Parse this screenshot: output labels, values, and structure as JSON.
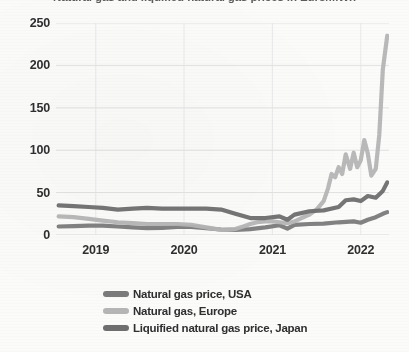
{
  "chart_data": {
    "type": "line",
    "title": "Natural gas and liquified natural gas prices in Euro/MWh",
    "xlabel": "",
    "ylabel": "",
    "ylim": [
      0,
      250
    ],
    "xlim": [
      2018.55,
      2022.32
    ],
    "yticks": [
      0,
      50,
      100,
      150,
      200,
      250
    ],
    "ytick_labels": [
      "0",
      "50",
      "100",
      "150",
      "200",
      "250"
    ],
    "xticks": [
      2019,
      2020,
      2021,
      2022
    ],
    "xtick_labels": [
      "2019",
      "2020",
      "2021",
      "2022"
    ],
    "grid": true,
    "grid_axis": "y",
    "legend_position": "bottom",
    "series": [
      {
        "name": "Natural gas price, USA",
        "color": "#7b7b7b",
        "x": [
          2018.58,
          2018.75,
          2018.92,
          2019.08,
          2019.25,
          2019.42,
          2019.58,
          2019.75,
          2019.92,
          2020.08,
          2020.25,
          2020.42,
          2020.58,
          2020.75,
          2020.92,
          2021.08,
          2021.17,
          2021.25,
          2021.42,
          2021.58,
          2021.75,
          2021.92,
          2022.0,
          2022.08,
          2022.17,
          2022.25,
          2022.3
        ],
        "values": [
          10,
          10.5,
          11,
          11,
          10,
          9,
          8,
          8.5,
          9.5,
          9.5,
          8,
          6.5,
          6,
          7,
          9,
          11.5,
          7.5,
          12,
          13,
          13.5,
          15,
          16,
          14.5,
          18,
          21,
          25,
          27
        ]
      },
      {
        "name": "Natural gas, Europe",
        "color": "#b5b5b5",
        "x": [
          2018.58,
          2018.75,
          2018.92,
          2019.08,
          2019.25,
          2019.42,
          2019.58,
          2019.75,
          2019.92,
          2020.08,
          2020.25,
          2020.42,
          2020.58,
          2020.67,
          2020.75,
          2020.83,
          2020.92,
          2021.0,
          2021.08,
          2021.17,
          2021.25,
          2021.33,
          2021.42,
          2021.5,
          2021.58,
          2021.63,
          2021.67,
          2021.71,
          2021.75,
          2021.79,
          2021.83,
          2021.88,
          2021.92,
          2021.96,
          2022.0,
          2022.04,
          2022.08,
          2022.12,
          2022.17,
          2022.21,
          2022.25,
          2022.3
        ],
        "values": [
          22,
          21,
          19,
          17,
          15,
          14,
          13,
          13,
          13,
          12,
          9,
          6,
          7,
          10,
          13,
          15,
          16,
          16,
          15,
          14,
          16,
          20,
          24,
          30,
          40,
          55,
          72,
          68,
          80,
          72,
          95,
          78,
          97,
          80,
          88,
          112,
          96,
          70,
          78,
          118,
          195,
          235
        ]
      },
      {
        "name": "Liquified natural gas price, Japan",
        "color": "#6e6e6e",
        "x": [
          2018.58,
          2018.75,
          2018.92,
          2019.08,
          2019.25,
          2019.42,
          2019.58,
          2019.75,
          2019.92,
          2020.08,
          2020.25,
          2020.42,
          2020.58,
          2020.75,
          2020.92,
          2021.08,
          2021.17,
          2021.25,
          2021.42,
          2021.58,
          2021.75,
          2021.83,
          2021.92,
          2022.0,
          2022.08,
          2022.17,
          2022.25,
          2022.3
        ],
        "values": [
          35,
          34,
          33,
          32,
          30,
          31,
          32,
          31,
          31,
          31,
          31,
          30,
          25,
          20,
          20,
          22,
          18,
          24,
          28,
          29,
          33,
          41,
          42,
          40,
          46,
          44,
          52,
          62
        ]
      }
    ]
  },
  "legend": {
    "items": [
      {
        "label": "Natural gas price, USA",
        "color": "#7b7b7b"
      },
      {
        "label": "Natural gas, Europe",
        "color": "#b5b5b5"
      },
      {
        "label": "Liquified natural gas price, Japan",
        "color": "#6e6e6e"
      }
    ]
  }
}
